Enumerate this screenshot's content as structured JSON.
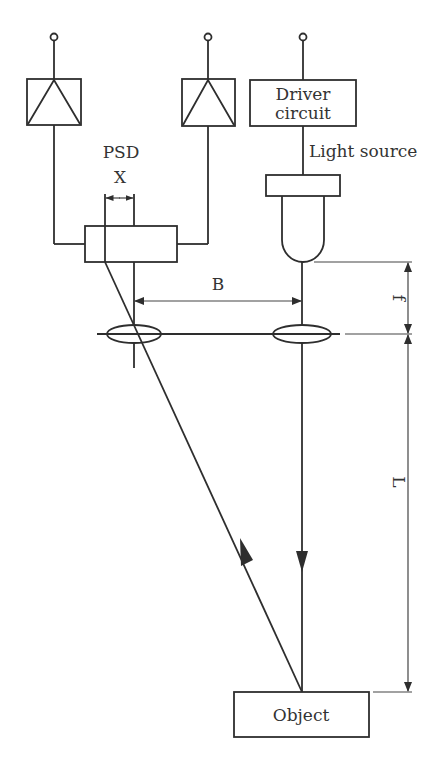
{
  "diagram": {
    "type": "optical triangulation position sensing schematic",
    "colors": {
      "line": "#2e2e2e",
      "text": "#333333",
      "background": "#ffffff"
    },
    "amplifiers": [
      {
        "id": "amp-left",
        "symbol": "amplifier-triangle"
      },
      {
        "id": "amp-right",
        "symbol": "amplifier-triangle"
      }
    ],
    "labels": {
      "driver_line1": "Driver",
      "driver_line2": "circuit",
      "light_source": "Light source",
      "psd": "PSD",
      "x": "X",
      "b": "B",
      "f": "f",
      "l": "L",
      "object": "Object"
    },
    "lenses": [
      {
        "id": "receiving-lens",
        "side": "left"
      },
      {
        "id": "emitting-lens",
        "side": "right"
      }
    ],
    "dimensions": [
      {
        "name": "X",
        "meaning": "spot displacement on PSD"
      },
      {
        "name": "B",
        "meaning": "baseline between lens axes"
      },
      {
        "name": "f",
        "meaning": "focal length"
      },
      {
        "name": "L",
        "meaning": "distance lens to object"
      }
    ]
  }
}
